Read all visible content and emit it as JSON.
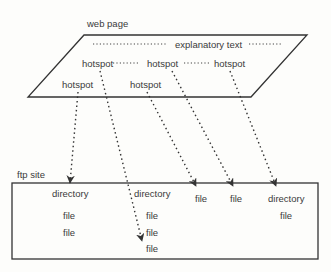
{
  "diagram": {
    "web_page": {
      "label": "web page",
      "explanatory_text": "explanatory text",
      "hotspots": [
        "hotspot",
        "hotspot",
        "hotspot",
        "hotspot",
        "hotspot"
      ]
    },
    "ftp_site": {
      "label": "ftp site",
      "columns": [
        {
          "items": [
            "directory",
            "file",
            "file"
          ]
        },
        {
          "items": [
            "directory",
            "file",
            "file",
            "file"
          ]
        },
        {
          "items": [
            "file"
          ]
        },
        {
          "items": [
            "file"
          ]
        },
        {
          "items": [
            "directory",
            "file"
          ]
        }
      ]
    },
    "colors": {
      "stroke": "#333333",
      "text": "#3a3a3a",
      "background": "#fdfdfb"
    }
  }
}
